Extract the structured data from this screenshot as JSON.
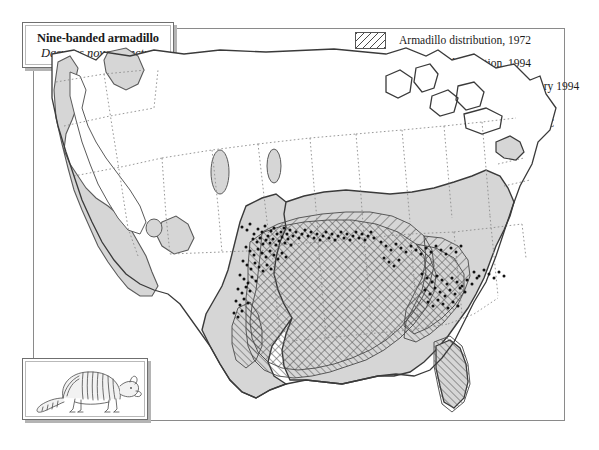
{
  "title_box": {
    "common_name": "Nine-banded armadillo",
    "scientific_name": "Dasypus novemcinctus"
  },
  "legend": {
    "items": [
      {
        "swatch": "hatch-backslash-sparse",
        "label": "Armadillo distribution, 1972"
      },
      {
        "swatch": "hatch-forwardslash-dense",
        "label": "Armadillo distribution, 1994"
      },
      {
        "swatch": "dots",
        "label": "Individual sightings after January 1994"
      },
      {
        "swatch": "solid-gray",
        "label": "Annual precipitation >38mm and\nmean January temperature >−2°C"
      }
    ]
  },
  "inset": {
    "illustration_name": "nine-banded-armadillo-illustration"
  },
  "caption": {
    "text": ""
  },
  "colors": {
    "climate_fill": "#d6d6d6",
    "hatch_stroke": "#4a4a4a",
    "state_border": "#8c8c8c",
    "coast_outline": "#3a3a3a",
    "frame_line": "#8a8a8a",
    "box_shadow": "#b4b4b4",
    "sighting_dot": "#111111"
  },
  "map": {
    "name": "united-states-armadillo-distribution-map",
    "features": {
      "climate_zone": "Annual precipitation >38mm and mean January temperature >-2C",
      "distribution_1972": "Armadillo distribution 1972",
      "distribution_1994": "Armadillo distribution 1994",
      "sightings": "Individual sightings after January 1994"
    },
    "sighting_points": [
      [
        208,
        181
      ],
      [
        213,
        184
      ],
      [
        216,
        178
      ],
      [
        220,
        188
      ],
      [
        224,
        183
      ],
      [
        228,
        186
      ],
      [
        231,
        180
      ],
      [
        234,
        190
      ],
      [
        237,
        185
      ],
      [
        240,
        182
      ],
      [
        243,
        188
      ],
      [
        219,
        193
      ],
      [
        223,
        196
      ],
      [
        226,
        192
      ],
      [
        229,
        198
      ],
      [
        232,
        194
      ],
      [
        236,
        197
      ],
      [
        239,
        193
      ],
      [
        242,
        199
      ],
      [
        245,
        195
      ],
      [
        248,
        191
      ],
      [
        251,
        197
      ],
      [
        254,
        193
      ],
      [
        257,
        199
      ],
      [
        247,
        186
      ],
      [
        250,
        182
      ],
      [
        253,
        188
      ],
      [
        256,
        184
      ],
      [
        259,
        190
      ],
      [
        262,
        186
      ],
      [
        265,
        192
      ],
      [
        268,
        188
      ],
      [
        271,
        184
      ],
      [
        274,
        190
      ],
      [
        277,
        186
      ],
      [
        280,
        192
      ],
      [
        283,
        188
      ],
      [
        286,
        194
      ],
      [
        289,
        190
      ],
      [
        292,
        186
      ],
      [
        295,
        192
      ],
      [
        298,
        188
      ],
      [
        301,
        194
      ],
      [
        304,
        190
      ],
      [
        307,
        186
      ],
      [
        310,
        192
      ],
      [
        313,
        188
      ],
      [
        316,
        194
      ],
      [
        319,
        190
      ],
      [
        322,
        186
      ],
      [
        325,
        192
      ],
      [
        328,
        188
      ],
      [
        331,
        194
      ],
      [
        334,
        190
      ],
      [
        337,
        186
      ],
      [
        340,
        192
      ],
      [
        212,
        201
      ],
      [
        216,
        205
      ],
      [
        220,
        209
      ],
      [
        224,
        203
      ],
      [
        228,
        207
      ],
      [
        232,
        211
      ],
      [
        236,
        205
      ],
      [
        240,
        209
      ],
      [
        244,
        213
      ],
      [
        248,
        207
      ],
      [
        252,
        211
      ],
      [
        209,
        215
      ],
      [
        213,
        219
      ],
      [
        217,
        223
      ],
      [
        221,
        217
      ],
      [
        225,
        221
      ],
      [
        229,
        225
      ],
      [
        233,
        219
      ],
      [
        237,
        223
      ],
      [
        206,
        229
      ],
      [
        210,
        233
      ],
      [
        214,
        237
      ],
      [
        218,
        231
      ],
      [
        222,
        235
      ],
      [
        204,
        243
      ],
      [
        208,
        247
      ],
      [
        212,
        241
      ],
      [
        216,
        245
      ],
      [
        202,
        255
      ],
      [
        206,
        259
      ],
      [
        210,
        253
      ],
      [
        214,
        257
      ],
      [
        200,
        267
      ],
      [
        204,
        271
      ],
      [
        208,
        265
      ],
      [
        347,
        196
      ],
      [
        352,
        200
      ],
      [
        357,
        204
      ],
      [
        362,
        198
      ],
      [
        367,
        202
      ],
      [
        372,
        206
      ],
      [
        377,
        200
      ],
      [
        382,
        204
      ],
      [
        387,
        208
      ],
      [
        392,
        202
      ],
      [
        397,
        206
      ],
      [
        402,
        200
      ],
      [
        407,
        204
      ],
      [
        412,
        208
      ],
      [
        417,
        202
      ],
      [
        422,
        206
      ],
      [
        427,
        200
      ],
      [
        350,
        212
      ],
      [
        355,
        216
      ],
      [
        360,
        220
      ],
      [
        365,
        214
      ],
      [
        388,
        228
      ],
      [
        393,
        232
      ],
      [
        398,
        236
      ],
      [
        403,
        230
      ],
      [
        408,
        234
      ],
      [
        413,
        238
      ],
      [
        418,
        232
      ],
      [
        423,
        236
      ],
      [
        428,
        240
      ],
      [
        433,
        234
      ],
      [
        438,
        238
      ],
      [
        443,
        232
      ],
      [
        391,
        244
      ],
      [
        396,
        248
      ],
      [
        401,
        242
      ],
      [
        406,
        246
      ],
      [
        411,
        250
      ],
      [
        416,
        244
      ],
      [
        421,
        248
      ],
      [
        426,
        242
      ],
      [
        431,
        246
      ],
      [
        394,
        256
      ],
      [
        399,
        260
      ],
      [
        404,
        254
      ],
      [
        409,
        258
      ],
      [
        414,
        262
      ],
      [
        419,
        256
      ],
      [
        424,
        260
      ],
      [
        440,
        226
      ],
      [
        445,
        230
      ],
      [
        450,
        224
      ],
      [
        455,
        228
      ],
      [
        460,
        232
      ],
      [
        465,
        226
      ],
      [
        470,
        230
      ]
    ]
  }
}
